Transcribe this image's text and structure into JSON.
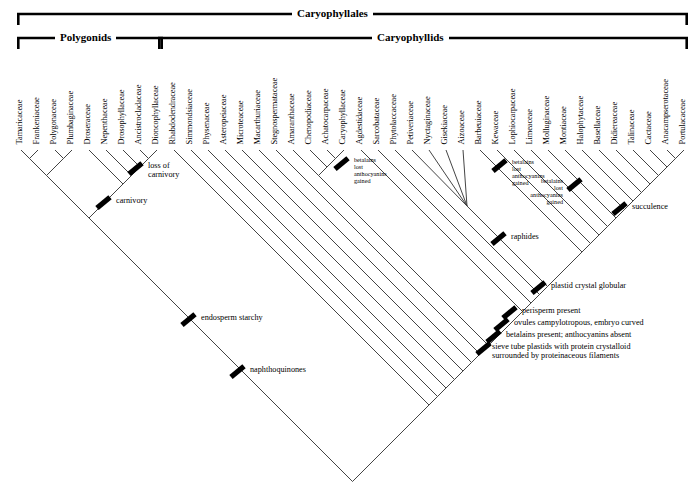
{
  "figure": {
    "type": "cladogram"
  },
  "brackets": [
    {
      "label": "Caryophyllales",
      "x1": 17,
      "x2": 688,
      "y": 14,
      "label_x": 292
    },
    {
      "label": "Polygonids",
      "x1": 17,
      "x2": 163,
      "y": 38,
      "label_x": 55
    },
    {
      "label": "Caryophyllids",
      "x1": 158,
      "x2": 688,
      "y": 38,
      "label_x": 372
    }
  ],
  "taxa": [
    {
      "name": "Tamaricaceae",
      "x": 21
    },
    {
      "name": "Frankeniaceae",
      "x": 38
    },
    {
      "name": "Polygonaceae",
      "x": 55
    },
    {
      "name": "Plumbaginaceae",
      "x": 72
    },
    {
      "name": "Droseraceae",
      "x": 89
    },
    {
      "name": "Nepenthaceae",
      "x": 106
    },
    {
      "name": "Drosophyllaceae",
      "x": 123
    },
    {
      "name": "Ancistrocladaceae",
      "x": 140
    },
    {
      "name": "Dioncophyllaceae",
      "x": 157
    },
    {
      "name": "Rhabdodendraceae",
      "x": 174
    },
    {
      "name": "Simmondsiaceae",
      "x": 191
    },
    {
      "name": "Physenaceae",
      "x": 208
    },
    {
      "name": "Asteropeiaceae",
      "x": 225
    },
    {
      "name": "Microteaceae",
      "x": 242
    },
    {
      "name": "Macarthuriaceae",
      "x": 259
    },
    {
      "name": "Stegnospermataceae",
      "x": 276
    },
    {
      "name": "Amaranthaceae",
      "x": 293
    },
    {
      "name": "Chenopodiaceae",
      "x": 310
    },
    {
      "name": "Achatocarpaceae",
      "x": 327
    },
    {
      "name": "Caryophyllaceae",
      "x": 344
    },
    {
      "name": "Agdestidaceae",
      "x": 361
    },
    {
      "name": "Sarcobataceae",
      "x": 378
    },
    {
      "name": "Phytolaccaceae",
      "x": 395
    },
    {
      "name": "Petiveriaceae",
      "x": 412
    },
    {
      "name": "Nyctaginaceae",
      "x": 429
    },
    {
      "name": "Gisekiaceae",
      "x": 446
    },
    {
      "name": "Aizoaceae",
      "x": 463
    },
    {
      "name": "Barbeuiaceae",
      "x": 480
    },
    {
      "name": "Kewaceae",
      "x": 497
    },
    {
      "name": "Lophiocarpaceae",
      "x": 514
    },
    {
      "name": "Limeaceae",
      "x": 531
    },
    {
      "name": "Molluginaceae",
      "x": 548
    },
    {
      "name": "Montiaceae",
      "x": 565
    },
    {
      "name": "Halophytaceae",
      "x": 582
    },
    {
      "name": "Basellaceae",
      "x": 599
    },
    {
      "name": "Didiereaceae",
      "x": 616
    },
    {
      "name": "Talinaceae",
      "x": 633
    },
    {
      "name": "Cactaceae",
      "x": 650
    },
    {
      "name": "Anacampserotaceae",
      "x": 667
    },
    {
      "name": "Portulacaceae",
      "x": 684
    }
  ],
  "annotations": [
    {
      "id": "loss-of-carnivory",
      "text": "loss of\ncarnivory",
      "bar_x": 127,
      "bar_y": 166,
      "text_x": 148,
      "text_y": 161,
      "align": "left",
      "size": "normal"
    },
    {
      "id": "carnivory",
      "text": "carnivory",
      "bar_x": 95,
      "bar_y": 200,
      "text_x": 116,
      "text_y": 196,
      "align": "left",
      "size": "normal"
    },
    {
      "id": "betalains-1",
      "text": "betalains\nlost\nanthocyanins\ngained",
      "bar_x": 333,
      "bar_y": 161,
      "text_x": 354,
      "text_y": 157,
      "align": "left",
      "size": "small"
    },
    {
      "id": "betalains-2",
      "text": "betalains\nlost\nanthocyanins\ngained",
      "bar_x": 491,
      "bar_y": 163,
      "text_x": 512,
      "text_y": 159,
      "align": "left",
      "size": "small"
    },
    {
      "id": "betalains-3",
      "text": "betalains\nlost\nanthocyanins\ngained",
      "bar_x": 566,
      "bar_y": 182,
      "text_x": 563,
      "text_y": 178,
      "align": "right",
      "size": "small"
    },
    {
      "id": "succulence",
      "text": "succulence",
      "bar_x": 611,
      "bar_y": 206,
      "text_x": 632,
      "text_y": 202,
      "align": "left",
      "size": "normal"
    },
    {
      "id": "raphides",
      "text": "raphides",
      "bar_x": 490,
      "bar_y": 236,
      "text_x": 511,
      "text_y": 232,
      "align": "left",
      "size": "normal"
    },
    {
      "id": "plastid-crystal",
      "text": "plastid crystal globular",
      "bar_x": 530,
      "bar_y": 285,
      "text_x": 551,
      "text_y": 281,
      "align": "left",
      "size": "normal"
    },
    {
      "id": "perisperm",
      "text": "perisperm present",
      "bar_x": 501,
      "bar_y": 310,
      "text_x": 522,
      "text_y": 306,
      "align": "left",
      "size": "normal"
    },
    {
      "id": "ovules",
      "text": "ovules campylotropous, embryo curved",
      "bar_x": 493,
      "bar_y": 322,
      "text_x": 514,
      "text_y": 318,
      "align": "left",
      "size": "normal"
    },
    {
      "id": "betalains-present",
      "text": "betalains present; anthocyanins absent",
      "bar_x": 485,
      "bar_y": 334,
      "text_x": 506,
      "text_y": 330,
      "align": "left",
      "size": "normal"
    },
    {
      "id": "sieve-tube",
      "text": "sieve tube plastids with protein crystalloid\nsurrounded by proteinaceous filaments",
      "bar_x": 475,
      "bar_y": 346,
      "text_x": 492,
      "text_y": 342,
      "align": "left",
      "size": "normal"
    },
    {
      "id": "endosperm-starchy",
      "text": "endosperm starchy",
      "bar_x": 180,
      "bar_y": 317,
      "text_x": 201,
      "text_y": 313,
      "align": "left",
      "size": "normal"
    },
    {
      "id": "naphthoquinones",
      "text": "naphthoquinones",
      "bar_x": 229,
      "bar_y": 369,
      "text_x": 250,
      "text_y": 365,
      "align": "left",
      "size": "normal"
    }
  ],
  "colors": {
    "line": "#3a3a3a",
    "bar": "#000000",
    "bracket": "#000000",
    "background": "#ffffff"
  }
}
